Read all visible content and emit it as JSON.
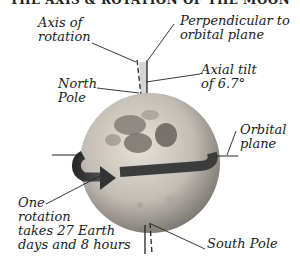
{
  "title": "THE AXIS & ROTATION OF THE MOON",
  "labels": {
    "axis_of_rotation": [
      "Axis of",
      "rotation"
    ],
    "perpendicular": [
      "Perpendicular to",
      "orbital plane"
    ],
    "axial_tilt": [
      "Axial tilt",
      "of 6.7°"
    ],
    "north_pole": [
      "North",
      "Pole"
    ],
    "orbital_plane": [
      "Orbital",
      "plane"
    ],
    "one_rotation": [
      "One",
      "rotation",
      "takes 27 Earth",
      "days and 8 hours"
    ],
    "south_pole": [
      "South Pole"
    ]
  },
  "colors": {
    "moon_light": "#d8d4cc",
    "moon_dark": "#6e6a64",
    "arrow": "#3a3a3a",
    "line": "#222222",
    "tilt_wedge": "#d4d4d4"
  }
}
